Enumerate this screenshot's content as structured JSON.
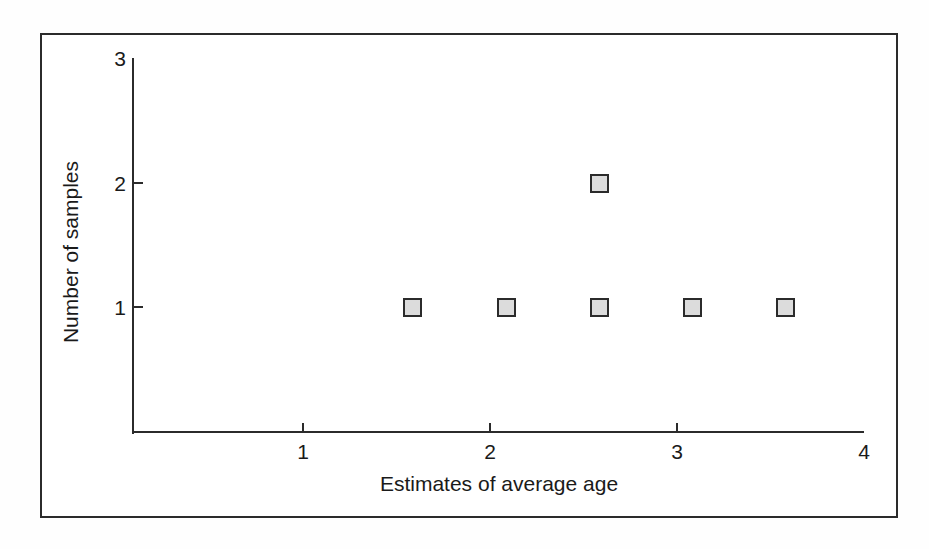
{
  "figure": {
    "background_color": "#fefefe",
    "frame_color": "#2b2b2b",
    "plot_background": "#ffffff"
  },
  "chart_data": {
    "type": "scatter",
    "title": "",
    "subtitle": "",
    "xlabel": "Estimates of average age",
    "ylabel": "Number of samples",
    "xlim": [
      0.2,
      4
    ],
    "ylim": [
      0,
      3
    ],
    "xticks": [
      1,
      2,
      3,
      4
    ],
    "xtick_labels": [
      "1",
      "2",
      "3",
      "4"
    ],
    "yticks": [
      1,
      2,
      3
    ],
    "ytick_labels": [
      "1",
      "2",
      "3"
    ],
    "grid": false,
    "legend": null,
    "marker_style": {
      "shape": "square",
      "fill_color": "#dcdcdc",
      "edge_color": "#2b2b2b",
      "size_px": 19
    },
    "points": [
      {
        "x": 1.5,
        "y": 1
      },
      {
        "x": 2.0,
        "y": 1
      },
      {
        "x": 2.5,
        "y": 1
      },
      {
        "x": 2.5,
        "y": 2
      },
      {
        "x": 3.0,
        "y": 1
      },
      {
        "x": 3.5,
        "y": 1
      }
    ],
    "annotations": []
  }
}
